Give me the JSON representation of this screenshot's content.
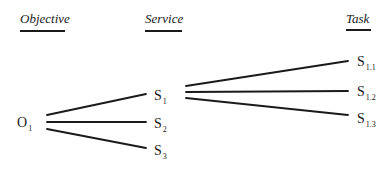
{
  "headers": {
    "objective": "Objective",
    "service": "Service",
    "task": "Task"
  },
  "nodes": {
    "objective": [
      {
        "letter": "O",
        "sub": "1"
      }
    ],
    "services": [
      {
        "letter": "S",
        "sub": "1"
      },
      {
        "letter": "S",
        "sub": "2"
      },
      {
        "letter": "S",
        "sub": "3"
      }
    ],
    "tasks": [
      {
        "letter": "S",
        "sub": "1.1"
      },
      {
        "letter": "S",
        "sub": "1.2"
      },
      {
        "letter": "S",
        "sub": "1.3"
      }
    ]
  },
  "edges": [
    {
      "from": "O1",
      "to": "S1"
    },
    {
      "from": "O1",
      "to": "S2"
    },
    {
      "from": "O1",
      "to": "S3"
    },
    {
      "from": "S1",
      "to": "S1.1"
    },
    {
      "from": "S1",
      "to": "S1.2"
    },
    {
      "from": "S1",
      "to": "S1.3"
    }
  ],
  "colors": {
    "ink": "#1a1a1a",
    "background": "#ffffff"
  }
}
